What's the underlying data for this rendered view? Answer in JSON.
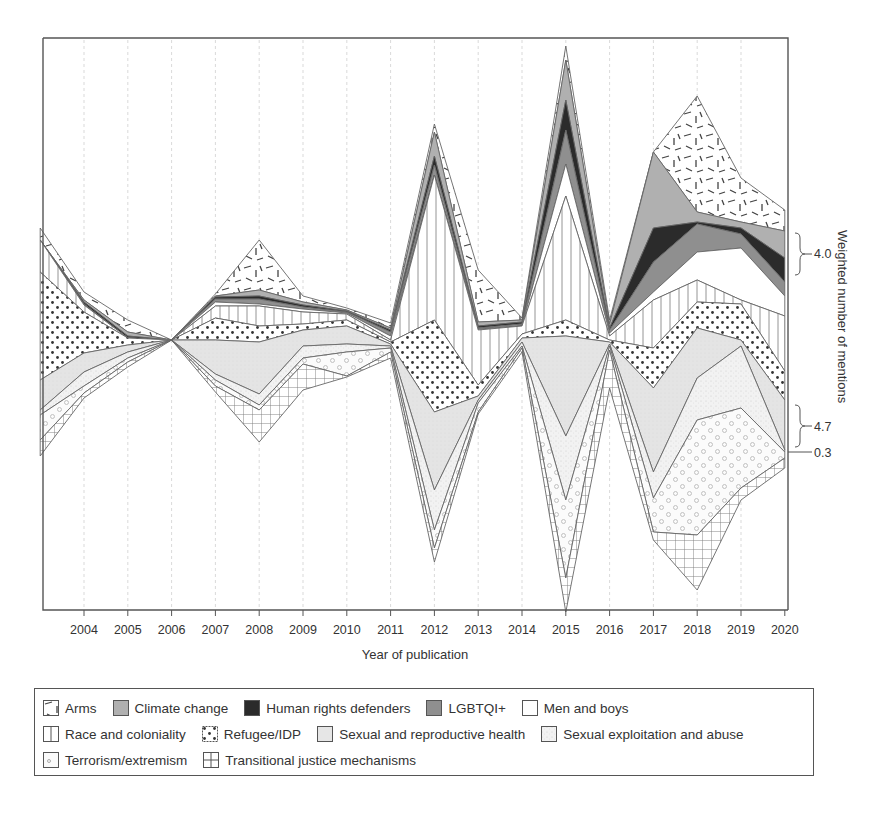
{
  "chart_data": {
    "type": "area",
    "subtype": "streamgraph",
    "title": "",
    "xlabel": "Year of publication",
    "ylabel": "Weighted number of mentions",
    "x": [
      2003,
      2004,
      2005,
      2006,
      2007,
      2008,
      2009,
      2010,
      2011,
      2012,
      2013,
      2014,
      2015,
      2016,
      2017,
      2018,
      2019,
      2020
    ],
    "x_tick_labels": [
      "2004",
      "2005",
      "2006",
      "2007",
      "2008",
      "2009",
      "2010",
      "2011",
      "2012",
      "2013",
      "2014",
      "2015",
      "2016",
      "2017",
      "2018",
      "2019",
      "2020"
    ],
    "grid": "vertical dashed lines at each year",
    "annotations": [
      {
        "label": "4.0",
        "position": "right bracket, upper",
        "refers_to": "Climate change + Human rights defenders + LGBTQI+ band at 2020"
      },
      {
        "label": "4.7",
        "position": "right bracket, lower",
        "refers_to": "Sexual and reproductive health band at 2020"
      },
      {
        "label": "0.3",
        "position": "right tick, lower",
        "refers_to": "Sexual exploitation and abuse at 2020"
      }
    ],
    "series_order_top_to_bottom": [
      "Arms",
      "Climate change",
      "Human rights defenders",
      "LGBTQI+",
      "Men and boys",
      "Race and coloniality",
      "Refugee/IDP",
      "Sexual and reproductive health",
      "Sexual exploitation and abuse",
      "Terrorism/extremism",
      "Transitional justice mechanisms"
    ],
    "boundaries_px_note": "Estimated pixel y-coordinates of the 12 stacked layer boundaries (top of Arms to bottom of Transitional justice) at each year; value thickness ∝ weighted mentions.",
    "boundaries_px": [
      [
        228,
        236,
        236,
        236,
        236,
        236,
        243,
        272,
        350,
        370,
        400,
        410,
        455
      ],
      [
        292,
        303,
        305,
        307,
        308,
        308,
        310,
        318,
        345,
        388,
        392,
        398,
        395
      ],
      [
        320,
        332,
        334,
        336,
        337,
        337,
        338,
        340,
        345,
        370,
        376,
        380,
        380
      ],
      [
        340,
        340,
        340,
        340,
        340,
        340,
        340,
        340,
        340,
        340,
        340,
        340,
        340
      ],
      [
        294,
        296,
        297,
        299,
        302,
        306,
        308,
        325,
        348,
        378,
        392,
        398,
        412
      ],
      [
        240,
        268,
        272,
        276,
        292,
        300,
        308,
        317,
        335,
        390,
        398,
        418,
        442
      ],
      [
        300,
        306,
        306,
        306,
        306,
        306,
        312,
        322,
        346,
        372,
        378,
        400,
        405
      ],
      [
        310,
        312,
        312,
        312,
        312,
        312,
        315,
        328,
        336,
        346,
        353,
        362,
        366
      ],
      [
        340,
        340,
        340,
        340,
        340,
        340,
        340,
        340,
        340,
        340,
        340,
        340,
        340
      ],
      [
        124,
        132,
        136,
        146,
        160,
        160,
        250,
        260,
        323,
        418,
        490,
        500,
        565
      ],
      [
        318,
        330,
        330,
        330,
        330,
        330,
        330,
        330,
        343,
        404,
        411,
        411,
        413
      ],
      [
        328,
        328,
        328,
        328,
        328,
        328,
        328,
        328,
        328,
        330,
        330,
        330,
        330
      ],
      [
        50,
        60,
        100,
        158,
        196,
        196,
        258,
        268,
        320,
        435,
        580,
        590,
        618
      ],
      [
        340,
        340,
        340,
        340,
        340,
        340,
        340,
        340,
        340,
        340,
        340,
        340,
        340
      ],
      [
        152,
        152,
        152,
        152,
        152,
        236,
        296,
        315,
        345,
        390,
        500,
        510,
        540
      ],
      [
        96,
        196,
        208,
        210,
        222,
        222,
        275,
        282,
        318,
        380,
        515,
        545,
        590
      ],
      [
        178,
        210,
        216,
        222,
        250,
        250,
        280,
        300,
        330,
        355,
        410,
        465,
        490
      ],
      [
        210,
        222,
        226,
        230,
        276,
        278,
        315,
        328,
        370,
        395,
        445,
        455,
        468
      ]
    ],
    "colors": {
      "Arms": "#ffffff",
      "Climate change": "#b0b0b0",
      "Human rights defenders": "#2b2b2b",
      "LGBTQI+": "#8f8f8f",
      "Men and boys": "#ffffff",
      "Race and coloniality": "#ffffff",
      "Refugee/IDP": "#ffffff",
      "Sexual and reproductive health": "#e6e6e6",
      "Sexual exploitation and abuse": "#efefef",
      "Terrorism/extremism": "#fafafa",
      "Transitional justice mechanisms": "#ffffff"
    }
  },
  "axis": {
    "x_title": "Year of publication",
    "y_title": "Weighted number of mentions",
    "ticks": [
      "2004",
      "2005",
      "2006",
      "2007",
      "2008",
      "2009",
      "2010",
      "2011",
      "2012",
      "2013",
      "2014",
      "2015",
      "2016",
      "2017",
      "2018",
      "2019",
      "2020"
    ],
    "annot_40": "4.0",
    "annot_47": "4.7",
    "annot_03": "0.3"
  },
  "legend": {
    "rows": [
      [
        "Arms",
        "Climate change",
        "Human rights defenders",
        "LGBTQI+",
        "Men and boys"
      ],
      [
        "Race and coloniality",
        "Refugee/IDP",
        "Sexual and reproductive health",
        "Sexual exploitation and abuse"
      ],
      [
        "Terrorism/extremism",
        "Transitional justice mechanisms"
      ]
    ],
    "items": {
      "arms": "Arms",
      "climate": "Climate change",
      "hrd": "Human rights defenders",
      "lgbtqi": "LGBTQI+",
      "men": "Men and boys",
      "race": "Race and coloniality",
      "refugee": "Refugee/IDP",
      "srh": "Sexual and reproductive health",
      "sea": "Sexual exploitation and abuse",
      "terror": "Terrorism/extremism",
      "tj": "Transitional justice mechanisms"
    }
  }
}
